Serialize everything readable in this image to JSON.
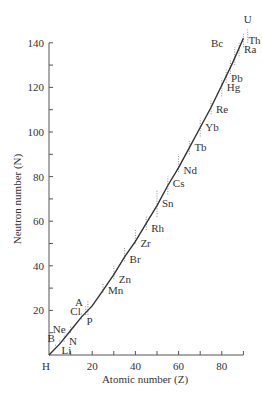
{
  "chart_data": {
    "type": "line",
    "title": "",
    "xlabel": "Atomic number (Z)",
    "ylabel": "Neutron number (N)",
    "xlim": [
      0,
      90
    ],
    "ylim": [
      0,
      140
    ],
    "x_ticks": [
      0,
      10,
      20,
      30,
      40,
      50,
      60,
      70,
      80,
      90
    ],
    "x_tick_labels": [
      {
        "value": 0,
        "label": "H"
      },
      {
        "value": 20,
        "label": "20"
      },
      {
        "value": 40,
        "label": "40"
      },
      {
        "value": 60,
        "label": "60"
      },
      {
        "value": 80,
        "label": "80"
      }
    ],
    "y_ticks": [
      10,
      20,
      30,
      40,
      50,
      60,
      70,
      80,
      90,
      100,
      110,
      120,
      130,
      140
    ],
    "y_tick_labels": [
      {
        "value": 20,
        "label": "20"
      },
      {
        "value": 40,
        "label": "40"
      },
      {
        "value": 60,
        "label": "60"
      },
      {
        "value": 80,
        "label": "80"
      },
      {
        "value": 100,
        "label": "100"
      },
      {
        "value": 120,
        "label": "120"
      },
      {
        "value": 140,
        "label": "140"
      }
    ],
    "grid": false,
    "legend": null,
    "series": [
      {
        "name": "Line of stability",
        "x": [
          0,
          5,
          10,
          15,
          20,
          25,
          30,
          35,
          40,
          45,
          50,
          55,
          60,
          65,
          70,
          75,
          80,
          85,
          90
        ],
        "y": [
          0,
          5,
          11,
          17,
          22,
          29,
          36,
          44,
          51,
          59,
          67,
          76,
          84,
          93,
          102,
          111,
          121,
          131,
          142
        ]
      }
    ],
    "isotope_ranges": [
      {
        "z": 3,
        "n_min": 3,
        "n_max": 5
      },
      {
        "z": 5,
        "n_min": 5,
        "n_max": 7
      },
      {
        "z": 7,
        "n_min": 6,
        "n_max": 9
      },
      {
        "z": 10,
        "n_min": 10,
        "n_max": 13
      },
      {
        "z": 15,
        "n_min": 16,
        "n_max": 19
      },
      {
        "z": 17,
        "n_min": 18,
        "n_max": 22
      },
      {
        "z": 18,
        "n_min": 18,
        "n_max": 24
      },
      {
        "z": 25,
        "n_min": 28,
        "n_max": 32
      },
      {
        "z": 30,
        "n_min": 34,
        "n_max": 40
      },
      {
        "z": 35,
        "n_min": 42,
        "n_max": 48
      },
      {
        "z": 40,
        "n_min": 50,
        "n_max": 56
      },
      {
        "z": 45,
        "n_min": 56,
        "n_max": 62
      },
      {
        "z": 50,
        "n_min": 62,
        "n_max": 74
      },
      {
        "z": 55,
        "n_min": 72,
        "n_max": 80
      },
      {
        "z": 60,
        "n_min": 82,
        "n_max": 90
      },
      {
        "z": 65,
        "n_min": 90,
        "n_max": 96
      },
      {
        "z": 70,
        "n_min": 98,
        "n_max": 106
      },
      {
        "z": 75,
        "n_min": 108,
        "n_max": 114
      },
      {
        "z": 80,
        "n_min": 116,
        "n_max": 124
      },
      {
        "z": 82,
        "n_min": 122,
        "n_max": 128
      },
      {
        "z": 84,
        "n_min": 126,
        "n_max": 132
      },
      {
        "z": 86,
        "n_min": 130,
        "n_max": 138
      },
      {
        "z": 88,
        "n_min": 134,
        "n_max": 140
      },
      {
        "z": 90,
        "n_min": 138,
        "n_max": 144
      },
      {
        "z": 92,
        "n_min": 140,
        "n_max": 146
      }
    ],
    "annotations": [
      {
        "label": "Li",
        "z": 3,
        "n": 4,
        "side": "below"
      },
      {
        "label": "B",
        "z": 5,
        "n": 6,
        "side": "left"
      },
      {
        "label": "N",
        "z": 7,
        "n": 7,
        "side": "right"
      },
      {
        "label": "Ne",
        "z": 10,
        "n": 10,
        "side": "left"
      },
      {
        "label": "P",
        "z": 15,
        "n": 16,
        "side": "right"
      },
      {
        "label": "Cl",
        "z": 17,
        "n": 18,
        "side": "left"
      },
      {
        "label": "A",
        "z": 18,
        "n": 22,
        "side": "left"
      },
      {
        "label": "Mn",
        "z": 25,
        "n": 30,
        "side": "right"
      },
      {
        "label": "Zn",
        "z": 30,
        "n": 35,
        "side": "right"
      },
      {
        "label": "Br",
        "z": 35,
        "n": 44,
        "side": "right"
      },
      {
        "label": "Zr",
        "z": 40,
        "n": 51,
        "side": "right"
      },
      {
        "label": "Rh",
        "z": 45,
        "n": 58,
        "side": "right"
      },
      {
        "label": "Sn",
        "z": 50,
        "n": 69,
        "side": "right"
      },
      {
        "label": "Cs",
        "z": 55,
        "n": 78,
        "side": "right"
      },
      {
        "label": "Nd",
        "z": 60,
        "n": 84,
        "side": "right"
      },
      {
        "label": "Tb",
        "z": 65,
        "n": 94,
        "side": "right"
      },
      {
        "label": "Yb",
        "z": 70,
        "n": 103,
        "side": "right"
      },
      {
        "label": "Re",
        "z": 75,
        "n": 111,
        "side": "right"
      },
      {
        "label": "Hg",
        "z": 80,
        "n": 121,
        "side": "right"
      },
      {
        "label": "Pb",
        "z": 82,
        "n": 125,
        "side": "right"
      },
      {
        "label": "Ra",
        "z": 88,
        "n": 138,
        "side": "right"
      },
      {
        "label": "Th",
        "z": 90,
        "n": 142,
        "side": "right"
      },
      {
        "label": "Bc",
        "z": 83,
        "n": 138,
        "side": "left"
      },
      {
        "label": "U",
        "z": 92,
        "n": 146,
        "side": "above"
      }
    ]
  }
}
